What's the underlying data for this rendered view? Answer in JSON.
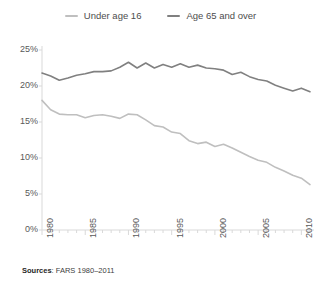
{
  "legend": {
    "position": "top-center",
    "entries": [
      {
        "label": "Under age 16",
        "color": "#bfbfbf",
        "marker": "dash-icon"
      },
      {
        "label": "Age 65 and over",
        "color": "#808080",
        "marker": "dash-icon"
      }
    ]
  },
  "footnote": {
    "label": "Sources",
    "separator": ":",
    "text": " FARS 1980–2011"
  },
  "axes": {
    "y_ticks": [
      "0%",
      "5%",
      "10%",
      "15%",
      "20%",
      "25%"
    ],
    "x_ticks": [
      "1980",
      "1985",
      "1990",
      "1995",
      "2000",
      "2005",
      "2010"
    ],
    "axis_color": "#d9d9d9"
  },
  "chart_data": {
    "type": "line",
    "title": "",
    "subtitle": "",
    "xlabel": "",
    "ylabel": "",
    "xlim": [
      1980,
      2011
    ],
    "ylim": [
      0,
      25
    ],
    "ytick_values": [
      0,
      5,
      10,
      15,
      20,
      25
    ],
    "ytick_labels": [
      "0%",
      "5%",
      "10%",
      "15%",
      "20%",
      "25%"
    ],
    "xtick_values": [
      1980,
      1985,
      1990,
      1995,
      2000,
      2005,
      2010
    ],
    "xtick_labels": [
      "1980",
      "1985",
      "1990",
      "1995",
      "2000",
      "2005",
      "2010"
    ],
    "grid": false,
    "legend_position": "top-center",
    "x": [
      1980,
      1981,
      1982,
      1983,
      1984,
      1985,
      1986,
      1987,
      1988,
      1989,
      1990,
      1991,
      1992,
      1993,
      1994,
      1995,
      1996,
      1997,
      1998,
      1999,
      2000,
      2001,
      2002,
      2003,
      2004,
      2005,
      2006,
      2007,
      2008,
      2009,
      2010,
      2011
    ],
    "series": [
      {
        "name": "Under age 16",
        "color": "#bfbfbf",
        "values": [
          18.0,
          16.7,
          16.1,
          16.0,
          16.0,
          15.6,
          15.9,
          16.0,
          15.8,
          15.5,
          16.1,
          16.0,
          15.3,
          14.5,
          14.3,
          13.6,
          13.4,
          12.4,
          12.0,
          12.2,
          11.6,
          11.9,
          11.4,
          10.8,
          10.2,
          9.7,
          9.4,
          8.7,
          8.2,
          7.6,
          7.2,
          6.3
        ]
      },
      {
        "name": "Age 65 and over",
        "color": "#808080",
        "values": [
          21.8,
          21.4,
          20.8,
          21.1,
          21.5,
          21.7,
          22.0,
          22.0,
          22.1,
          22.6,
          23.3,
          22.5,
          23.2,
          22.5,
          23.0,
          22.6,
          23.1,
          22.6,
          22.9,
          22.5,
          22.4,
          22.2,
          21.6,
          21.9,
          21.3,
          20.9,
          20.7,
          20.1,
          19.7,
          19.3,
          19.7,
          19.2
        ]
      }
    ]
  }
}
